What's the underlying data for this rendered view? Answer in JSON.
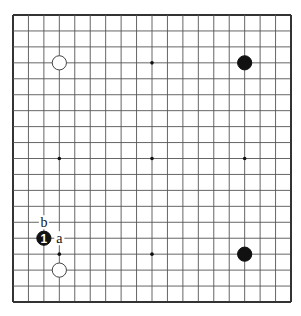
{
  "diagram": {
    "type": "go-board",
    "size": 19,
    "geometry": {
      "left": 13,
      "top": 15,
      "right": 291,
      "bottom": 302
    },
    "colors": {
      "line": "#555555",
      "border": "#333333",
      "black": "#111111",
      "white": "#ffffff",
      "background": "#ffffff"
    },
    "star_points": [
      [
        3,
        3
      ],
      [
        9,
        3
      ],
      [
        15,
        3
      ],
      [
        3,
        9
      ],
      [
        9,
        9
      ],
      [
        15,
        9
      ],
      [
        3,
        15
      ],
      [
        9,
        15
      ],
      [
        15,
        15
      ]
    ],
    "stones": [
      {
        "col": 3,
        "row": 3,
        "color": "white",
        "label": ""
      },
      {
        "col": 15,
        "row": 3,
        "color": "black",
        "label": ""
      },
      {
        "col": 15,
        "row": 15,
        "color": "black",
        "label": ""
      },
      {
        "col": 3,
        "row": 16,
        "color": "white",
        "label": ""
      },
      {
        "col": 2,
        "row": 14,
        "color": "black",
        "label": "1"
      }
    ],
    "markers": [
      {
        "col": 3,
        "row": 14,
        "text": "a"
      },
      {
        "col": 2,
        "row": 13,
        "text": "b"
      }
    ]
  }
}
